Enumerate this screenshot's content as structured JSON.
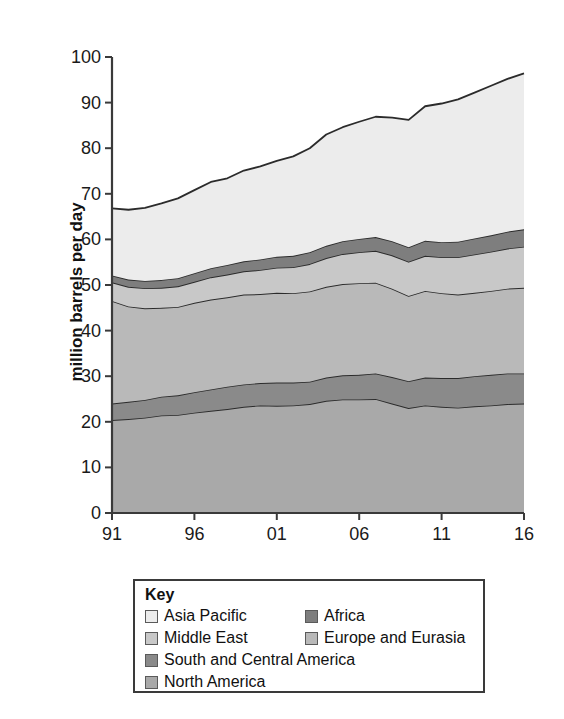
{
  "chart_data": {
    "type": "area",
    "title": "",
    "subtitle": "",
    "xlabel": "",
    "ylabel": "million barrels per day",
    "xlim": [
      1991,
      2016
    ],
    "ylim": [
      0,
      100
    ],
    "grid": false,
    "stacked": true,
    "legend_position": "bottom",
    "legend_title": "Key",
    "x": [
      1991,
      1992,
      1993,
      1994,
      1995,
      1996,
      1997,
      1998,
      1999,
      2000,
      2001,
      2002,
      2003,
      2004,
      2005,
      2006,
      2007,
      2008,
      2009,
      2010,
      2011,
      2012,
      2013,
      2014,
      2015,
      2016
    ],
    "xtick_labels": [
      "91",
      "96",
      "01",
      "06",
      "11",
      "16"
    ],
    "xtick_values": [
      1991,
      1996,
      2001,
      2006,
      2011,
      2016
    ],
    "ytick_labels": [
      "0",
      "10",
      "20",
      "30",
      "40",
      "50",
      "60",
      "70",
      "80",
      "90",
      "100"
    ],
    "ytick_values": [
      0,
      10,
      20,
      30,
      40,
      50,
      60,
      70,
      80,
      90,
      100
    ],
    "series": [
      {
        "name": "North America",
        "color": "#a9a9a9",
        "values": [
          20.4,
          20.6,
          20.9,
          21.4,
          21.5,
          22.0,
          22.4,
          22.8,
          23.3,
          23.6,
          23.5,
          23.6,
          23.9,
          24.6,
          24.9,
          24.9,
          25.0,
          24.0,
          23.0,
          23.6,
          23.3,
          23.1,
          23.4,
          23.6,
          23.9,
          24.0
        ],
        "description": "bottom band"
      },
      {
        "name": "South and Central America",
        "color": "#8a8a8a",
        "values": [
          3.6,
          3.8,
          3.9,
          4.1,
          4.3,
          4.5,
          4.7,
          4.9,
          4.9,
          4.9,
          5.1,
          5.0,
          4.9,
          5.1,
          5.3,
          5.4,
          5.6,
          5.8,
          5.9,
          6.1,
          6.3,
          6.5,
          6.6,
          6.7,
          6.7,
          6.6
        ],
        "description": "second band from bottom, darker"
      },
      {
        "name": "Europe and Eurasia",
        "color": "#b9b9b9",
        "values": [
          22.5,
          20.9,
          20.1,
          19.5,
          19.4,
          19.6,
          19.7,
          19.6,
          19.7,
          19.5,
          19.7,
          19.6,
          19.8,
          19.9,
          20.0,
          20.1,
          19.9,
          19.4,
          18.7,
          19.0,
          18.6,
          18.3,
          18.3,
          18.4,
          18.6,
          18.8
        ],
        "description": "third band, light-medium"
      },
      {
        "name": "Middle East",
        "color": "#c8c8c8",
        "values": [
          4.1,
          4.3,
          4.4,
          4.4,
          4.5,
          4.6,
          4.9,
          5.0,
          5.1,
          5.3,
          5.5,
          5.7,
          6.0,
          6.3,
          6.6,
          6.8,
          7.0,
          7.3,
          7.5,
          7.7,
          7.9,
          8.2,
          8.4,
          8.6,
          8.8,
          9.0
        ],
        "description": "thin band"
      },
      {
        "name": "Africa",
        "color": "#7e7e7e",
        "values": [
          1.5,
          1.6,
          1.6,
          1.7,
          1.8,
          1.9,
          2.0,
          2.1,
          2.2,
          2.3,
          2.4,
          2.5,
          2.6,
          2.7,
          2.8,
          2.9,
          3.0,
          3.1,
          3.2,
          3.3,
          3.3,
          3.4,
          3.5,
          3.6,
          3.7,
          3.8
        ],
        "description": "thin dark band"
      },
      {
        "name": "Asia Pacific",
        "color": "#ececec",
        "values": [
          14.7,
          15.3,
          16.0,
          16.8,
          17.5,
          18.2,
          18.9,
          19.0,
          19.9,
          20.4,
          21.0,
          21.8,
          22.8,
          24.4,
          25.0,
          25.7,
          26.4,
          27.1,
          27.9,
          29.5,
          30.4,
          31.2,
          32.0,
          32.8,
          33.5,
          34.2
        ],
        "description": "top band, lightest"
      }
    ],
    "cumulative_totals": [
      66.8,
      66.5,
      66.9,
      67.9,
      69.0,
      70.8,
      72.6,
      73.4,
      75.1,
      76.0,
      77.2,
      78.2,
      80.0,
      83.0,
      84.6,
      85.8,
      86.9,
      86.7,
      86.2,
      89.2,
      89.8,
      90.7,
      92.2,
      93.7,
      95.2,
      96.4
    ],
    "annotations": []
  },
  "legend": {
    "title": "Key",
    "rows": [
      [
        {
          "label": "Asia Pacific",
          "color": "#ececec"
        },
        {
          "label": "Africa",
          "color": "#7e7e7e"
        }
      ],
      [
        {
          "label": "Middle East",
          "color": "#c8c8c8"
        },
        {
          "label": "Europe and Eurasia",
          "color": "#b9b9b9"
        }
      ],
      [
        {
          "label": "South and Central America",
          "color": "#8a8a8a"
        }
      ],
      [
        {
          "label": "North America",
          "color": "#a9a9a9"
        }
      ]
    ]
  },
  "axes": {
    "y_title": "million barrels per day",
    "y_ticks": [
      "100",
      "90",
      "80",
      "70",
      "60",
      "50",
      "40",
      "30",
      "20",
      "10",
      "0"
    ],
    "x_ticks": [
      "91",
      "96",
      "01",
      "06",
      "11",
      "16"
    ]
  },
  "colors": {
    "axis": "#3a3a3a",
    "line": "#2b2b2b",
    "background": "#ffffff"
  }
}
